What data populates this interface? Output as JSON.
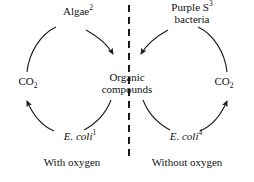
{
  "diagram": {
    "type": "carbon-cycle-comparison",
    "divider": {
      "name": "vertical-dashed-divider",
      "style": "dashed",
      "orientation": "vertical"
    },
    "colors": {
      "background": "#ffffff",
      "ink": "#111111",
      "stroke": "#1a1a1a"
    },
    "nodes": {
      "algae": {
        "text": "Algae",
        "superscript": "2"
      },
      "purple_bacteria": {
        "line1": "Purple S",
        "superscript": "3",
        "line2": "bacteria"
      },
      "co2_left": {
        "formula": "CO",
        "subscript": "2"
      },
      "co2_right": {
        "formula": "CO",
        "subscript": "2"
      },
      "organic": {
        "line1": "Organic",
        "line2": "compounds"
      },
      "ecoli_left": {
        "text": "E. coli",
        "superscript": "1"
      },
      "ecoli_right": {
        "text": "E. coli",
        "superscript": "4"
      }
    },
    "captions": {
      "left": "With oxygen",
      "right": "Without oxygen"
    },
    "arrows": [
      {
        "name": "arrow-co2-left-to-algae",
        "from": "co2_left",
        "to": "algae",
        "arrowhead": false
      },
      {
        "name": "arrow-algae-to-organic",
        "from": "algae",
        "to": "organic",
        "arrowhead": true
      },
      {
        "name": "arrow-purple-to-organic",
        "from": "purple_bacteria",
        "to": "organic",
        "arrowhead": true
      },
      {
        "name": "arrow-co2-right-to-purple",
        "from": "co2_right",
        "to": "purple_bacteria",
        "arrowhead": false
      },
      {
        "name": "arrow-organic-to-ecoli-left",
        "from": "organic",
        "to": "ecoli_left",
        "arrowhead": false
      },
      {
        "name": "arrow-ecoli-left-to-co2-left",
        "from": "ecoli_left",
        "to": "co2_left",
        "arrowhead": true
      },
      {
        "name": "arrow-organic-to-ecoli-right",
        "from": "organic",
        "to": "ecoli_right",
        "arrowhead": false
      },
      {
        "name": "arrow-ecoli-right-to-co2-right",
        "from": "ecoli_right",
        "to": "co2_right",
        "arrowhead": true
      }
    ]
  }
}
